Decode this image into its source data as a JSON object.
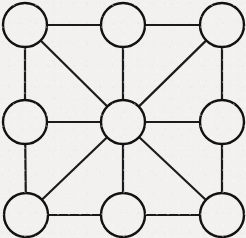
{
  "diagram": {
    "type": "node-link-diagram",
    "background_color": "#f2f1ef",
    "node_stroke_color": "#121212",
    "node_fill_color": "none",
    "edge_stroke_color": "#1b1b1b",
    "node_radius": 22,
    "node_stroke_width": 2.4,
    "edge_stroke_width": 2.2,
    "canvas": {
      "width": 246,
      "height": 238
    },
    "node_count": "9",
    "edge_count": "16",
    "nodes": [
      {
        "id": "top-left",
        "label": "",
        "cx": 25,
        "cy": 25,
        "degree": "3"
      },
      {
        "id": "top-center",
        "label": "",
        "cx": 123,
        "cy": 25,
        "degree": "3"
      },
      {
        "id": "top-right",
        "label": "",
        "cx": 222,
        "cy": 25,
        "degree": "3"
      },
      {
        "id": "middle-left",
        "label": "",
        "cx": 25,
        "cy": 122,
        "degree": "3"
      },
      {
        "id": "center",
        "label": "",
        "cx": 123,
        "cy": 122,
        "degree": "8"
      },
      {
        "id": "middle-right",
        "label": "",
        "cx": 222,
        "cy": 122,
        "degree": "3"
      },
      {
        "id": "bottom-left",
        "label": "",
        "cx": 26,
        "cy": 215,
        "degree": "3"
      },
      {
        "id": "bottom-center",
        "label": "",
        "cx": 123,
        "cy": 215,
        "degree": "3"
      },
      {
        "id": "bottom-right",
        "label": "",
        "cx": 222,
        "cy": 215,
        "degree": "3"
      }
    ],
    "edges": [
      {
        "id": "edge-tl-tc",
        "source": "top-left",
        "target": "top-center",
        "kind": "horizontal"
      },
      {
        "id": "edge-tc-tr",
        "source": "top-center",
        "target": "top-right",
        "kind": "horizontal"
      },
      {
        "id": "edge-ml-c",
        "source": "middle-left",
        "target": "center",
        "kind": "horizontal"
      },
      {
        "id": "edge-c-mr",
        "source": "center",
        "target": "middle-right",
        "kind": "horizontal"
      },
      {
        "id": "edge-bl-bc",
        "source": "bottom-left",
        "target": "bottom-center",
        "kind": "horizontal"
      },
      {
        "id": "edge-bc-br",
        "source": "bottom-center",
        "target": "bottom-right",
        "kind": "horizontal"
      },
      {
        "id": "edge-tl-ml",
        "source": "top-left",
        "target": "middle-left",
        "kind": "vertical"
      },
      {
        "id": "edge-ml-bl",
        "source": "middle-left",
        "target": "bottom-left",
        "kind": "vertical"
      },
      {
        "id": "edge-tc-c",
        "source": "top-center",
        "target": "center",
        "kind": "vertical"
      },
      {
        "id": "edge-c-bc",
        "source": "center",
        "target": "bottom-center",
        "kind": "vertical"
      },
      {
        "id": "edge-tr-mr",
        "source": "top-right",
        "target": "middle-right",
        "kind": "vertical"
      },
      {
        "id": "edge-mr-br",
        "source": "middle-right",
        "target": "bottom-right",
        "kind": "vertical"
      },
      {
        "id": "edge-tl-c",
        "source": "top-left",
        "target": "center",
        "kind": "diagonal"
      },
      {
        "id": "edge-tr-c",
        "source": "top-right",
        "target": "center",
        "kind": "diagonal"
      },
      {
        "id": "edge-bl-c",
        "source": "bottom-left",
        "target": "center",
        "kind": "diagonal"
      },
      {
        "id": "edge-br-c",
        "source": "bottom-right",
        "target": "center",
        "kind": "diagonal"
      }
    ]
  }
}
